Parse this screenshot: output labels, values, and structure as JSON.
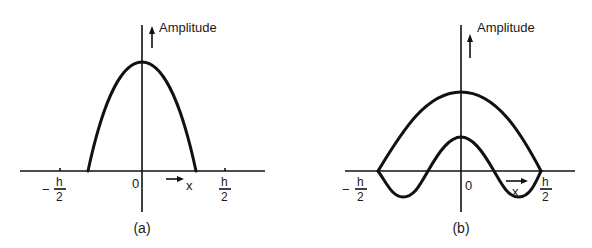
{
  "figure": {
    "panels": [
      {
        "id": "a",
        "caption": "(a)",
        "y_axis_label": "Amplitude",
        "origin_label": "0",
        "x_axis_label": "x",
        "neg_tick": {
          "sign": "−",
          "num": "h",
          "den": "2"
        },
        "pos_tick": {
          "num": "h",
          "den": "2"
        },
        "curves": [
          {
            "name": "fundamental-mode",
            "shape": "single parabolic hump, zero outside |x| < ~0.33h"
          }
        ]
      },
      {
        "id": "b",
        "caption": "(b)",
        "y_axis_label": "Amplitude",
        "origin_label": "0",
        "x_axis_label": "x",
        "neg_tick": {
          "sign": "−",
          "num": "h",
          "den": "2"
        },
        "pos_tick": {
          "num": "h",
          "den": "2"
        },
        "curves": [
          {
            "name": "first-mode",
            "shape": "broad arch from −h/2 to h/2"
          },
          {
            "name": "higher-mode",
            "shape": "central peak with negative lobes, zeros at ±h/2"
          }
        ]
      }
    ]
  }
}
